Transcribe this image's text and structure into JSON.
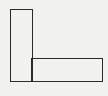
{
  "diagram": {
    "background": "#f1f1f0",
    "stroke": "#2a2a2a",
    "shapes": [
      {
        "id": "vertical-rect",
        "x": 10,
        "y": 9,
        "width": 22,
        "height": 72
      },
      {
        "id": "horizontal-rect",
        "x": 32,
        "y": 59,
        "width": 70,
        "height": 22
      }
    ]
  }
}
